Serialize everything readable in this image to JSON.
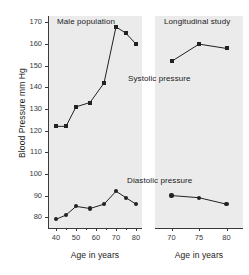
{
  "chart_data": {
    "type": "line",
    "title": "",
    "ylabel": "Blood Pressure mm Hg",
    "ylim": [
      75,
      173
    ],
    "yticks": [
      80,
      90,
      100,
      110,
      120,
      130,
      140,
      150,
      160,
      170
    ],
    "grid": false,
    "legend_position": "inline-annotations",
    "panels": [
      {
        "name": "left-panel",
        "annotation": "Male population",
        "xlabel": "Age in years",
        "xlim": [
          36,
          83
        ],
        "xticks": [
          40,
          50,
          60,
          70,
          80
        ],
        "xticks_minor": [
          45,
          55,
          65,
          75
        ],
        "series": [
          {
            "name": "Systolic pressure",
            "marker": "square",
            "x": [
              40,
              45,
              50,
              57,
              64,
              70,
              75,
              80
            ],
            "values": [
              122,
              122,
              131,
              133,
              142,
              168,
              165,
              160
            ]
          },
          {
            "name": "Diastolic pressure",
            "marker": "circle",
            "x": [
              40,
              45,
              50,
              57,
              64,
              70,
              75,
              80
            ],
            "values": [
              79,
              81,
              85,
              84,
              86,
              92,
              89,
              86
            ]
          }
        ]
      },
      {
        "name": "right-panel",
        "annotation": "Longitudinal study",
        "xlabel": "Age in years",
        "xlim": [
          67,
          83
        ],
        "xticks": [
          70,
          75,
          80
        ],
        "xticks_minor": [],
        "series": [
          {
            "name": "Systolic pressure",
            "marker": "square",
            "x": [
              70,
              75,
              80
            ],
            "values": [
              152,
              160,
              158
            ]
          },
          {
            "name": "Diastolic pressure",
            "marker": "circle",
            "x": [
              70,
              75,
              80
            ],
            "values": [
              90,
              89,
              86
            ]
          }
        ]
      }
    ],
    "annotations": [
      {
        "text": "Male population",
        "panel": "left",
        "role": "panel-title"
      },
      {
        "text": "Longitudinal study",
        "panel": "right",
        "role": "panel-title"
      },
      {
        "text": "Systolic pressure",
        "panel": "left",
        "role": "series-label"
      },
      {
        "text": "Diastolic pressure",
        "panel": "left",
        "role": "series-label"
      }
    ]
  },
  "axes": {
    "y_title": "Blood Pressure mm Hg",
    "y_labels": [
      "170",
      "160",
      "150",
      "140",
      "130",
      "120",
      "110",
      "100",
      "90",
      "80"
    ],
    "left_x_labels": [
      "40",
      "50",
      "60",
      "70",
      "80"
    ],
    "right_x_labels": [
      "70",
      "75",
      "80"
    ],
    "left_x_title": "Age in years",
    "right_x_title": "Age in years"
  },
  "labels": {
    "male_population": "Male population",
    "longitudinal_study": "Longitudinal study",
    "systolic": "Systolic pressure",
    "diastolic": "Diastolic pressure"
  },
  "colors": {
    "plot_background": "#ebebeb",
    "page_background": "#ffffff",
    "marker": "#222222",
    "axis": "#3a3a3a",
    "text": "#1a1a1a"
  }
}
